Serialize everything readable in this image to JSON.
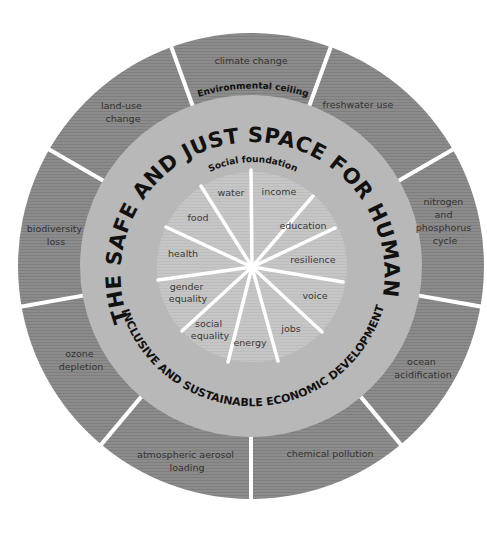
{
  "diagram": {
    "title": "THE SAFE AND JUST SPACE FOR HUMANITY",
    "subtitle": "INCLUSIVE AND SUSTAINABLE ECONOMIC DEVELOPMENT",
    "outer_ring_label": "Environmental ceiling",
    "inner_ring_label": "Social foundation",
    "environmental_ceiling": [
      {
        "id": "climate",
        "lines": [
          "climate change"
        ]
      },
      {
        "id": "freshwater",
        "lines": [
          "freshwater use"
        ]
      },
      {
        "id": "nitrogen",
        "lines": [
          "nitrogen",
          "and",
          "phosphorus",
          "cycle"
        ]
      },
      {
        "id": "ocean",
        "lines": [
          "ocean",
          "acidification"
        ]
      },
      {
        "id": "chemical",
        "lines": [
          "chemical pollution"
        ]
      },
      {
        "id": "aerosol",
        "lines": [
          "atmospheric aerosol",
          "loading"
        ]
      },
      {
        "id": "ozone",
        "lines": [
          "ozone",
          "depletion"
        ]
      },
      {
        "id": "biodiversity",
        "lines": [
          "biodiversity",
          "loss"
        ]
      },
      {
        "id": "landuse",
        "lines": [
          "land-use",
          "change"
        ]
      }
    ],
    "social_foundation": [
      {
        "id": "income",
        "lines": [
          "income"
        ]
      },
      {
        "id": "education",
        "lines": [
          "education"
        ]
      },
      {
        "id": "resilience",
        "lines": [
          "resilience"
        ]
      },
      {
        "id": "voice",
        "lines": [
          "voice"
        ]
      },
      {
        "id": "jobs",
        "lines": [
          "jobs"
        ]
      },
      {
        "id": "energy",
        "lines": [
          "energy"
        ]
      },
      {
        "id": "social-equality",
        "lines": [
          "social",
          "equality"
        ]
      },
      {
        "id": "gender-equality",
        "lines": [
          "gender",
          "equality"
        ]
      },
      {
        "id": "health",
        "lines": [
          "health"
        ]
      },
      {
        "id": "food",
        "lines": [
          "food"
        ]
      },
      {
        "id": "water",
        "lines": [
          "water"
        ]
      }
    ],
    "colors": {
      "outer_ring": "#8a8a8a",
      "middle_ring": "#b9b9b9",
      "inner_disc": "#c4c4c4",
      "spokes": "#ffffff",
      "text": "#111111"
    }
  }
}
